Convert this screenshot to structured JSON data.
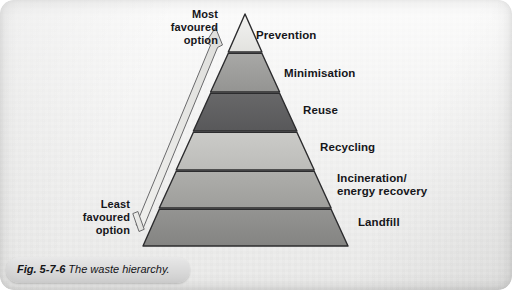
{
  "figure": {
    "caption_number": "Fig. 5-7-6",
    "caption_text": "The waste hierarchy.",
    "background_color": "#f2f2f1",
    "diagram_type": "waste-hierarchy-pyramid"
  },
  "arrows": {
    "up": {
      "label_line1": "Most",
      "label_line2": "favoured",
      "label_line3": "option",
      "direction": "up",
      "color": "#e9e9e7",
      "outline_color": "#58585a"
    },
    "down": {
      "label_line1": "Least",
      "label_line2": "favoured",
      "label_line3": "option",
      "direction": "down",
      "color": "#e9e9e7",
      "outline_color": "#58585a"
    }
  },
  "pyramid": {
    "outline_color": "#2c2c2e",
    "tiers": [
      {
        "label": "Prevention",
        "fill": "#ececea",
        "rank": 1
      },
      {
        "label": "Minimisation",
        "fill": "#9e9e9c",
        "rank": 2
      },
      {
        "label": "Reuse",
        "fill": "#5f5f61",
        "rank": 3
      },
      {
        "label": "Recycling",
        "fill": "#c4c4c1",
        "rank": 4
      },
      {
        "label": "Incineration/",
        "label2": "energy recovery",
        "fill": "#a6a6a3",
        "rank": 5
      },
      {
        "label": "Landfill",
        "fill": "#8c8c8a",
        "rank": 6
      }
    ]
  }
}
